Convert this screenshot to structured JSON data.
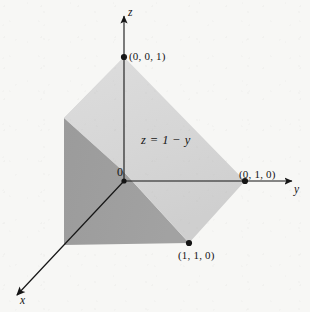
{
  "figure": {
    "kind": "3d-coordinate-diagram",
    "background_color": "#f7f7f5",
    "ink_color": "#151515",
    "axes": [
      {
        "name": "x",
        "label": "x",
        "style": "italic",
        "direction": "down-left"
      },
      {
        "name": "y",
        "label": "y",
        "style": "italic",
        "direction": "right"
      },
      {
        "name": "z",
        "label": "z",
        "style": "italic",
        "direction": "up"
      }
    ],
    "origin_label": "0",
    "surface_equation": "z = 1 − y",
    "points": [
      {
        "name": "point-001",
        "label": "(0, 0, 1)",
        "coords": [
          0,
          0,
          1
        ],
        "px": [
          124,
          57
        ]
      },
      {
        "name": "point-010",
        "label": "(0, 1, 0)",
        "coords": [
          0,
          1,
          0
        ],
        "px": [
          245,
          181
        ]
      },
      {
        "name": "point-110",
        "label": "(1, 1, 0)",
        "coords": [
          1,
          1,
          0
        ],
        "px": [
          189,
          243
        ]
      }
    ],
    "faces": [
      {
        "name": "slanted-plane-face",
        "fill": "#d8d8d8",
        "description": "plane z = 1 - y"
      },
      {
        "name": "left-side-face",
        "fill": "#9d9d9d",
        "description": "x-z side of solid"
      },
      {
        "name": "top-left-face",
        "fill": "#d2d2d2",
        "description": "upper left face"
      }
    ]
  }
}
